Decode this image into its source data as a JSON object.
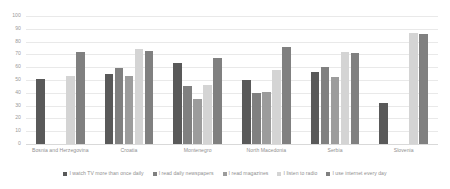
{
  "chart_data": {
    "type": "bar",
    "title": "",
    "subtitle": "",
    "xlabel": "",
    "ylabel": "",
    "ylim": [
      0,
      100
    ],
    "yticks": [
      0,
      10,
      20,
      30,
      40,
      50,
      60,
      70,
      80,
      90,
      100
    ],
    "grid": true,
    "legend_position": "bottom",
    "orientation": "vertical",
    "grouping": "grouped",
    "categories": [
      "Bosnia and Herzegovina",
      "Croatia",
      "Montenegro",
      "North Macedonia",
      "Serbia",
      "Slovenia"
    ],
    "series": [
      {
        "name": "I watch TV more than once daily",
        "color": "#595959",
        "values": [
          51,
          55,
          63,
          50,
          56,
          32
        ]
      },
      {
        "name": "I read daily newspapers",
        "color": "#808080",
        "values": [
          null,
          59,
          45,
          40,
          60,
          null
        ]
      },
      {
        "name": "I read magazines",
        "color": "#9c9c9c",
        "values": [
          null,
          53,
          35,
          41,
          52,
          null
        ]
      },
      {
        "name": "I listen to radio",
        "color": "#d4d4d4",
        "values": [
          53,
          74,
          46,
          58,
          72,
          87
        ]
      },
      {
        "name": "I use internet every day",
        "color": "#808080",
        "values": [
          72,
          73,
          67,
          76,
          71,
          86
        ]
      }
    ]
  },
  "axis": {
    "tick_labels": [
      "100",
      "90",
      "80",
      "70",
      "60",
      "50",
      "40",
      "30",
      "20",
      "10",
      "0"
    ],
    "tick_color": "#9a9a9a",
    "gridline_color": "#e9e9e9"
  },
  "legend": {
    "items": [
      {
        "label": "I watch TV more than once daily",
        "color": "#595959"
      },
      {
        "label": "I read daily newspapers",
        "color": "#808080"
      },
      {
        "label": "I read magazines",
        "color": "#9c9c9c"
      },
      {
        "label": "I listen to radio",
        "color": "#d4d4d4"
      },
      {
        "label": "I use internet every day",
        "color": "#808080"
      }
    ]
  }
}
